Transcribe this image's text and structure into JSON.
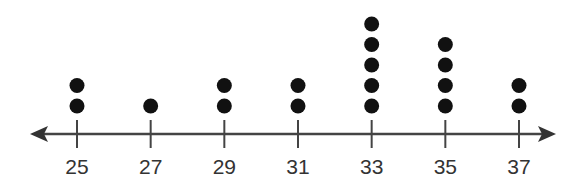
{
  "chart_data": {
    "type": "scatter",
    "subtype": "dot_plot",
    "title": "",
    "xlabel": "",
    "ylabel": "",
    "categories": [
      "25",
      "27",
      "29",
      "31",
      "33",
      "35",
      "37"
    ],
    "x": [
      25,
      27,
      29,
      31,
      33,
      35,
      37
    ],
    "values": [
      2,
      1,
      2,
      2,
      5,
      4,
      2
    ],
    "xlim": [
      24,
      38
    ],
    "grid": false,
    "legend": null,
    "axis_arrows": "both"
  },
  "colors": {
    "dot": "#111111",
    "axis": "#444444",
    "text": "#333333"
  }
}
